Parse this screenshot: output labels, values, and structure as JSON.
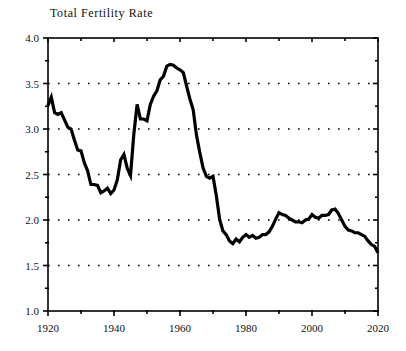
{
  "chart_data": {
    "type": "line",
    "title": "Total Fertility Rate",
    "xlabel": "",
    "ylabel": "",
    "xlim": [
      1920,
      2020
    ],
    "ylim": [
      1.0,
      4.0
    ],
    "grid": "horizontal-dotted",
    "legend": "none",
    "ytick_labels": [
      "4.0",
      "3.5",
      "3.0",
      "2.5",
      "2.0",
      "1.5",
      "1.0"
    ],
    "ytick_values": [
      4.0,
      3.5,
      3.0,
      2.5,
      2.0,
      1.5,
      1.0
    ],
    "yminor_values": [
      3.75,
      3.25,
      2.75,
      2.25,
      1.75,
      1.25
    ],
    "xtick_labels": [
      "1920",
      "1940",
      "1960",
      "1980",
      "2000",
      "2020"
    ],
    "xtick_values": [
      1920,
      1940,
      1960,
      1980,
      2000,
      2020
    ],
    "xminor_values": [
      1930,
      1950,
      1970,
      1990,
      2010
    ],
    "gridline_values": [
      3.5,
      3.0,
      2.5,
      2.0,
      1.5
    ],
    "series": [
      {
        "name": "Total Fertility Rate",
        "color": "#000000",
        "x": [
          1920,
          1921,
          1922,
          1923,
          1924,
          1925,
          1926,
          1927,
          1928,
          1929,
          1930,
          1931,
          1932,
          1933,
          1934,
          1935,
          1936,
          1937,
          1938,
          1939,
          1940,
          1941,
          1942,
          1943,
          1944,
          1945,
          1946,
          1947,
          1948,
          1949,
          1950,
          1951,
          1952,
          1953,
          1954,
          1955,
          1956,
          1957,
          1958,
          1959,
          1960,
          1961,
          1962,
          1963,
          1964,
          1965,
          1966,
          1967,
          1968,
          1969,
          1970,
          1971,
          1972,
          1973,
          1974,
          1975,
          1976,
          1977,
          1978,
          1979,
          1980,
          1981,
          1982,
          1983,
          1984,
          1985,
          1986,
          1987,
          1988,
          1989,
          1990,
          1991,
          1992,
          1993,
          1994,
          1995,
          1996,
          1997,
          1998,
          1999,
          2000,
          2001,
          2002,
          2003,
          2004,
          2005,
          2006,
          2007,
          2008,
          2009,
          2010,
          2011,
          2012,
          2013,
          2014,
          2015,
          2016,
          2017,
          2018,
          2019,
          2020
        ],
        "values": [
          3.26,
          3.35,
          3.18,
          3.16,
          3.18,
          3.1,
          3.02,
          3.0,
          2.88,
          2.77,
          2.76,
          2.63,
          2.54,
          2.39,
          2.39,
          2.38,
          2.3,
          2.32,
          2.35,
          2.29,
          2.33,
          2.44,
          2.66,
          2.72,
          2.57,
          2.49,
          2.94,
          3.27,
          3.11,
          3.11,
          3.09,
          3.27,
          3.36,
          3.42,
          3.54,
          3.58,
          3.69,
          3.71,
          3.7,
          3.67,
          3.65,
          3.62,
          3.47,
          3.33,
          3.21,
          2.93,
          2.74,
          2.57,
          2.48,
          2.46,
          2.48,
          2.27,
          2.01,
          1.88,
          1.84,
          1.77,
          1.74,
          1.79,
          1.76,
          1.81,
          1.84,
          1.81,
          1.83,
          1.8,
          1.81,
          1.84,
          1.84,
          1.87,
          1.93,
          2.01,
          2.08,
          2.06,
          2.05,
          2.02,
          2.0,
          1.98,
          1.98,
          1.97,
          2.0,
          2.01,
          2.06,
          2.03,
          2.02,
          2.05,
          2.05,
          2.06,
          2.11,
          2.12,
          2.07,
          2.0,
          1.93,
          1.89,
          1.88,
          1.86,
          1.86,
          1.84,
          1.82,
          1.77,
          1.73,
          1.71,
          1.64
        ]
      }
    ]
  }
}
